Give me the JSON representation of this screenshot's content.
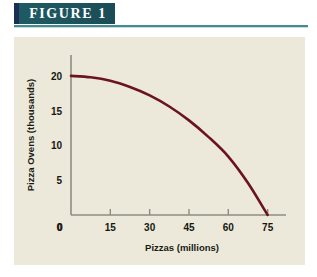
{
  "figure": {
    "badge_label": "FIGURE  1",
    "accent_color": "#1b2f56",
    "badge_color": "#1d535d",
    "rule_color": "#3f8d95",
    "panel_color": "#ece9da"
  },
  "chart_data": {
    "type": "line",
    "title": "",
    "subtitle": "",
    "xlabel": "Pizzas (millions)",
    "ylabel": "Pizza Ovens (thousands)",
    "xlim": [
      0,
      82
    ],
    "ylim": [
      0,
      23
    ],
    "xticks": [
      "0",
      "15",
      "30",
      "45",
      "60",
      "75"
    ],
    "xtick_values": [
      0,
      15,
      30,
      45,
      60,
      75
    ],
    "yticks": [
      "0",
      "5",
      "10",
      "15",
      "20"
    ],
    "ytick_values": [
      0,
      5,
      10,
      15,
      20
    ],
    "grid": false,
    "legend": null,
    "line_color": "#6b1420",
    "axis_color": "#8c8c80",
    "series": [
      {
        "name": "Production Possibilities Frontier",
        "x": [
          0,
          7.5,
          15,
          22.5,
          30,
          37.5,
          45,
          52.5,
          60,
          67.5,
          75
        ],
        "values": [
          20.0,
          19.8,
          19.3,
          18.4,
          17.2,
          15.6,
          13.6,
          11.2,
          8.4,
          4.6,
          0.0
        ]
      }
    ],
    "annotations": []
  }
}
